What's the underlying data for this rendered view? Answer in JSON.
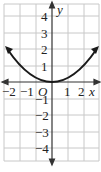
{
  "graph": {
    "function": "y = x^2 / 4 (parabola, vertex at origin)",
    "axes": {
      "x_label": "x",
      "y_label": "y",
      "origin_label": "O"
    },
    "x_ticks": [
      "-2",
      "-1",
      "1",
      "2"
    ],
    "y_ticks": [
      "4",
      "3",
      "2",
      "1",
      "-1",
      "-2",
      "-3",
      "-4"
    ],
    "x_range": [
      -3,
      3
    ],
    "y_range": [
      -4.8,
      4.7
    ],
    "grid": true,
    "colors": {
      "grid": "#c8c8c8",
      "axis": "#333333",
      "curve": "#1a1a1a"
    }
  }
}
